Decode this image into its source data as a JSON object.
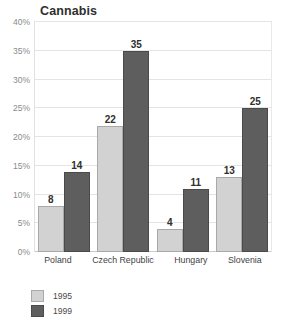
{
  "chart_data": {
    "type": "bar",
    "title": "Cannabis",
    "xlabel": "",
    "ylabel": "",
    "ylim": [
      0,
      40
    ],
    "ytick_labels": [
      "0%",
      "5%",
      "10%",
      "15%",
      "20%",
      "25%",
      "30%",
      "35%",
      "40%"
    ],
    "ytick_values": [
      0,
      5,
      10,
      15,
      20,
      25,
      30,
      35,
      40
    ],
    "grid": true,
    "legend_position": "bottom-left",
    "categories": [
      "Poland",
      "Czech Republic",
      "Hungary",
      "Slovenia"
    ],
    "series": [
      {
        "name": "1995",
        "color": "#d2d2d2",
        "values": [
          8,
          22,
          4,
          13
        ],
        "labels": [
          "8",
          "22",
          "4",
          "13"
        ]
      },
      {
        "name": "1999",
        "color": "#5e5e5e",
        "values": [
          14,
          35,
          11,
          25
        ],
        "labels": [
          "14",
          "35",
          "11",
          "25"
        ]
      }
    ]
  }
}
